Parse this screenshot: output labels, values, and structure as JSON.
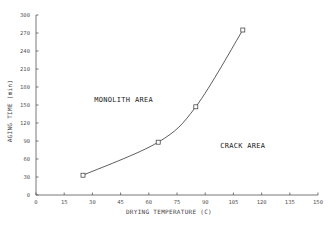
{
  "chart_data": {
    "type": "line",
    "title": "",
    "xlabel": "DRYING TEMPERATURE (C)",
    "ylabel": "AGING TIME (min)",
    "xlim": [
      0,
      150
    ],
    "ylim": [
      0,
      300
    ],
    "xticks": [
      0,
      15,
      30,
      45,
      60,
      75,
      90,
      105,
      120,
      135,
      150
    ],
    "yticks": [
      0,
      30,
      60,
      90,
      120,
      150,
      180,
      210,
      240,
      270,
      300
    ],
    "grid": false,
    "series": [
      {
        "name": "boundary",
        "marker": "square",
        "x": [
          25,
          65,
          85,
          110
        ],
        "y": [
          33,
          88,
          147,
          275
        ]
      }
    ],
    "annotations": [
      {
        "text": "MONOLITH AREA",
        "x": 31,
        "y": 155
      },
      {
        "text": "CRACK AREA",
        "x": 98,
        "y": 78
      }
    ]
  }
}
